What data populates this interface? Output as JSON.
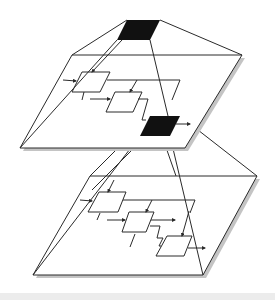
{
  "diagram": {
    "title": "",
    "colors": {
      "stroke": "#2a2a2a",
      "fill_highlight": "#111111",
      "plane_fill": "#ffffff",
      "shadow": "#bdbdbd",
      "background": "#ffffff",
      "footer": "#ececec"
    },
    "levels": [
      {
        "name": "top-level-block",
        "type": "black-block"
      },
      {
        "name": "upper-plane",
        "blocks": 3,
        "highlighted_block": 3
      },
      {
        "name": "lower-plane",
        "blocks": 3
      }
    ]
  }
}
